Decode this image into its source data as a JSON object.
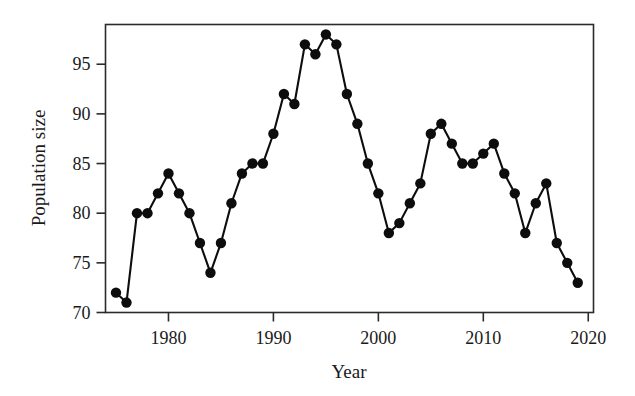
{
  "chart_data": {
    "type": "line",
    "title": "",
    "subtitle": "",
    "xlabel": "Year",
    "ylabel": "Population size",
    "xlim": [
      1974,
      2020.5
    ],
    "ylim": [
      70,
      99
    ],
    "xticks": [
      1980,
      1990,
      2000,
      2010,
      2020
    ],
    "xtick_labels": [
      "1980",
      "1990",
      "2000",
      "2010",
      "2020"
    ],
    "yticks": [
      70,
      75,
      80,
      85,
      90,
      95
    ],
    "ytick_labels": [
      "70",
      "75",
      "80",
      "85",
      "90",
      "95"
    ],
    "grid": false,
    "legend": false,
    "legend_position": "none",
    "marker": "filled-circle",
    "line_color": "#0d0d0d",
    "marker_color": "#0d0d0d",
    "x": [
      1975,
      1976,
      1977,
      1978,
      1979,
      1980,
      1981,
      1982,
      1983,
      1984,
      1985,
      1986,
      1987,
      1988,
      1989,
      1990,
      1991,
      1992,
      1993,
      1994,
      1995,
      1996,
      1997,
      1998,
      1999,
      2000,
      2001,
      2002,
      2003,
      2004,
      2005,
      2006,
      2007,
      2008,
      2009,
      2010,
      2011,
      2012,
      2013,
      2014,
      2015,
      2016,
      2017,
      2018,
      2019
    ],
    "values": [
      72,
      71,
      80,
      80,
      82,
      84,
      82,
      80,
      77,
      74,
      77,
      81,
      84,
      85,
      85,
      88,
      92,
      91,
      97,
      96,
      98,
      97,
      92,
      89,
      85,
      82,
      78,
      79,
      81,
      83,
      88,
      89,
      87,
      85,
      85,
      86,
      87,
      84,
      82,
      78,
      81,
      83,
      77,
      75,
      73
    ],
    "series": [
      {
        "name": "Population size",
        "values": [
          72,
          71,
          80,
          80,
          82,
          84,
          82,
          80,
          77,
          74,
          77,
          81,
          84,
          85,
          85,
          88,
          92,
          91,
          97,
          96,
          98,
          97,
          92,
          89,
          85,
          82,
          78,
          79,
          81,
          83,
          88,
          89,
          87,
          85,
          85,
          86,
          87,
          84,
          82,
          78,
          81,
          83,
          77,
          75,
          73
        ]
      }
    ],
    "annotations": []
  }
}
